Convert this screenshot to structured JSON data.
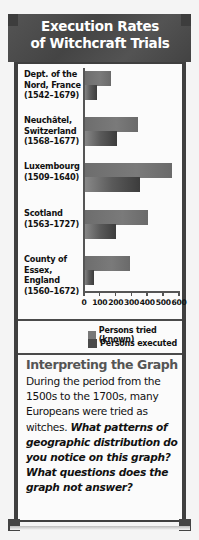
{
  "title": {
    "line1": "Execution Rates",
    "line2": "of Witchcraft Trials"
  },
  "chart_data": {
    "type": "bar",
    "orientation": "horizontal",
    "title": "Execution Rates of Witchcraft Trials",
    "categories": [
      "Dept. of the Nord, France (1542–1679)",
      "Neuchâtel, Switzerland (1568–1677)",
      "Luxembourg (1509–1640)",
      "Scotland (1563–1727)",
      "County of Essex, England (1560–1672)"
    ],
    "series": [
      {
        "name": "Persons tried (known)",
        "color": "#747474",
        "values": [
          170,
          340,
          555,
          405,
          290
        ]
      },
      {
        "name": "Persons executed",
        "color": "#4a4a4a",
        "values": [
          80,
          210,
          355,
          200,
          60
        ]
      }
    ],
    "xlabel": "",
    "ylabel": "",
    "xlim": [
      0,
      600
    ],
    "xticks": [
      0,
      100,
      200,
      300,
      400,
      500,
      600
    ],
    "grid": false,
    "legend_position": "bottom-right"
  },
  "chart": {
    "categories": [
      {
        "lines": [
          "Dept. of the",
          "Nord, France",
          "(1542–1679)"
        ]
      },
      {
        "lines": [
          "Neuchâtel,",
          "Switzerland",
          "(1568–1677)"
        ]
      },
      {
        "lines": [
          "Luxembourg",
          "(1509–1640)"
        ]
      },
      {
        "lines": [
          "Scotland",
          "(1563–1727)"
        ]
      },
      {
        "lines": [
          "County of",
          "Essex,",
          "England",
          "(1560–1672)"
        ]
      }
    ],
    "ticks": [
      "0",
      "100",
      "200",
      "300",
      "400",
      "500",
      "600"
    ]
  },
  "legend": {
    "tried": "Persons tried (known)",
    "executed": "Persons executed"
  },
  "interpreting": {
    "heading": "Interpreting the Graph",
    "body": "During the period from the 1500s to the 1700s, many Europeans were tried as witches.",
    "question": "What patterns of geographic distribution do you notice on this graph? What questions does the graph not answer?"
  }
}
